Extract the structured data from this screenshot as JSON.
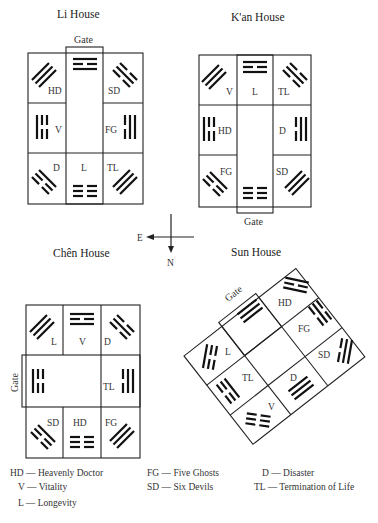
{
  "houses": {
    "li": {
      "title": "Li House",
      "gate_label": "Gate",
      "cells": {
        "top_left": "HD",
        "top_right": "SD",
        "mid_left": "V",
        "mid_right": "FG",
        "bot_left": "D",
        "bot_mid": "L",
        "bot_right": "TL"
      }
    },
    "kan": {
      "title": "K'an House",
      "gate_label": "Gate",
      "cells": {
        "top_left": "V",
        "top_mid": "L",
        "top_right": "TL",
        "mid_left": "HD",
        "mid_right": "D",
        "bot_left": "FG",
        "bot_right": "SD"
      }
    },
    "chen": {
      "title": "Chên House",
      "gate_label": "Gate",
      "cells": {
        "top_left": "L",
        "top_mid": "V",
        "top_right": "D",
        "mid_right": "TL",
        "bot_left": "SD",
        "bot_mid": "HD",
        "bot_right": "FG"
      }
    },
    "sun": {
      "title": "Sun House",
      "gate_label": "Gate",
      "cells": {
        "hd": "HD",
        "fg": "FG",
        "sd": "SD",
        "d": "D",
        "v": "V",
        "tl": "TL",
        "l": "L"
      }
    }
  },
  "compass": {
    "east": "E",
    "north": "N"
  },
  "legend": [
    {
      "abbr": "HD",
      "meaning": "Heavenly Doctor",
      "text": "HD — Heavenly Doctor"
    },
    {
      "abbr": "V",
      "meaning": "Vitality",
      "text": "V — Vitality"
    },
    {
      "abbr": "L",
      "meaning": "Longevity",
      "text": "L — Longevity"
    },
    {
      "abbr": "FG",
      "meaning": "Five Ghosts",
      "text": "FG — Five Ghosts"
    },
    {
      "abbr": "SD",
      "meaning": "Six Devils",
      "text": "SD — Six Devils"
    },
    {
      "abbr": "D",
      "meaning": "Disaster",
      "text": "D — Disaster"
    },
    {
      "abbr": "TL",
      "meaning": "Termination of Life",
      "text": "TL — Termination of Life"
    }
  ]
}
